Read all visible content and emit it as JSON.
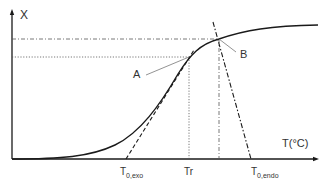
{
  "diagram": {
    "type": "sigmoid-conversion-curve-with-tangents",
    "y_axis_label": "X",
    "x_axis_label": "T(°C)",
    "points": [
      {
        "id": "A",
        "label": "A"
      },
      {
        "id": "B",
        "label": "B"
      }
    ],
    "x_ticks": [
      {
        "main": "T",
        "sub": "0,exo"
      },
      {
        "main": "Tr",
        "sub": ""
      },
      {
        "main": "T",
        "sub": "0,endo"
      }
    ],
    "colors": {
      "curve": "#1a1a1a",
      "axis": "#1a1a1a",
      "guides": "#555555",
      "leader": "#777777"
    }
  }
}
